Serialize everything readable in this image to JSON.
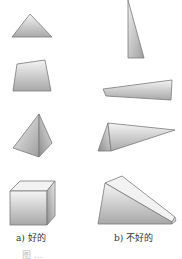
{
  "figure": {
    "left_label": "a) 好的",
    "right_label": "b) 不好的",
    "caption_partial": "图 ...",
    "colors": {
      "fill_light": "#f2f2f2",
      "fill_dark": "#a6a6a6",
      "stroke": "#7a7a7a"
    },
    "left_column": [
      {
        "shape": "triangle",
        "quality": "good"
      },
      {
        "shape": "quadrilateral",
        "quality": "good"
      },
      {
        "shape": "tetrahedron",
        "quality": "good"
      },
      {
        "shape": "hexahedron",
        "quality": "good"
      }
    ],
    "right_column": [
      {
        "shape": "triangle",
        "quality": "bad"
      },
      {
        "shape": "quadrilateral",
        "quality": "bad"
      },
      {
        "shape": "tetrahedron",
        "quality": "bad"
      },
      {
        "shape": "hexahedron",
        "quality": "bad"
      }
    ]
  }
}
